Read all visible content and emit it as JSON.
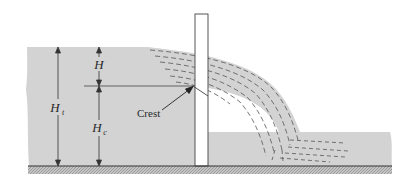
{
  "diagram": {
    "type": "sharp-crested weir cross-section",
    "labels": {
      "head": "H",
      "total_height": "H",
      "total_height_sub": "t",
      "crest_height": "H",
      "crest_height_sub": "c",
      "crest": "Crest"
    },
    "colors": {
      "water": "#d3d3d3",
      "weir_plate": "#ffffff",
      "lines": "#333333",
      "ground_hatch": "#9a9a9a",
      "background": "#ffffff"
    }
  }
}
